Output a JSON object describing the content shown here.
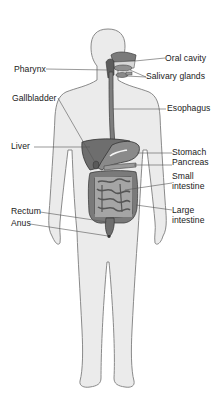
{
  "diagram": {
    "colors": {
      "body_fill": "#ebebeb",
      "body_outline": "#8a8a8a",
      "organ_dark": "#6e6e6e",
      "organ_mid": "#8c8c8c",
      "organ_outline": "#3c3c3c",
      "leader_line": "#555555",
      "label_text": "#1a1a1a"
    },
    "labels": {
      "oral_cavity": "Oral cavity",
      "pharynx": "Pharynx",
      "salivary_glands": "Salivary glands",
      "gallbladder": "Gallbladder",
      "esophagus": "Esophagus",
      "liver": "Liver",
      "stomach": "Stomach",
      "pancreas": "Pancreas",
      "small_intestine_1": "Small",
      "small_intestine_2": "intestine",
      "large_intestine_1": "Large",
      "large_intestine_2": "intestine",
      "rectum": "Rectum",
      "anus": "Anus"
    }
  }
}
